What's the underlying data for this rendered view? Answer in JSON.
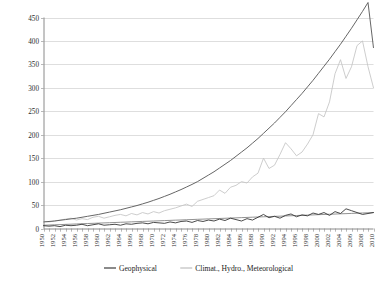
{
  "chart_data": {
    "type": "line",
    "title": "",
    "subtitle": "",
    "xlabel": "",
    "ylabel": "",
    "xlim": [
      1950,
      2010
    ],
    "ylim": [
      0,
      450
    ],
    "ytick_step": 50,
    "xtick_step": 1,
    "xlabel_step": 2,
    "grid": true,
    "legend_position": "bottom",
    "yticks": [
      "0",
      "50",
      "100",
      "150",
      "200",
      "250",
      "300",
      "350",
      "400",
      "450"
    ],
    "xticks": [
      "1950",
      "1952",
      "1954",
      "1956",
      "1958",
      "1960",
      "1962",
      "1964",
      "1966",
      "1968",
      "1970",
      "1972",
      "1974",
      "1976",
      "1978",
      "1980",
      "1982",
      "1984",
      "1986",
      "1988",
      "1990",
      "1992",
      "1994",
      "1996",
      "1998",
      "2000",
      "2002",
      "2004",
      "2006",
      "2008",
      "2010"
    ],
    "x": [
      1950,
      1951,
      1952,
      1953,
      1954,
      1955,
      1956,
      1957,
      1958,
      1959,
      1960,
      1961,
      1962,
      1963,
      1964,
      1965,
      1966,
      1967,
      1968,
      1969,
      1970,
      1971,
      1972,
      1973,
      1974,
      1975,
      1976,
      1977,
      1978,
      1979,
      1980,
      1981,
      1982,
      1983,
      1984,
      1985,
      1986,
      1987,
      1988,
      1989,
      1990,
      1991,
      1992,
      1993,
      1994,
      1995,
      1996,
      1997,
      1998,
      1999,
      2000,
      2001,
      2002,
      2003,
      2004,
      2005,
      2006,
      2007,
      2008,
      2009,
      2010
    ],
    "series": [
      {
        "name": "Geophysical",
        "color": "#2a2a2a",
        "style": "solid",
        "values": [
          6,
          5,
          6,
          4,
          7,
          6,
          7,
          9,
          6,
          8,
          10,
          7,
          8,
          9,
          7,
          10,
          9,
          11,
          12,
          10,
          13,
          12,
          11,
          14,
          12,
          15,
          16,
          13,
          17,
          15,
          18,
          16,
          20,
          17,
          22,
          19,
          16,
          21,
          18,
          24,
          30,
          23,
          26,
          22,
          28,
          31,
          25,
          29,
          27,
          33,
          30,
          34,
          28,
          36,
          32,
          42,
          38,
          34,
          30,
          32,
          34
        ]
      },
      {
        "name": "Geophysical trend",
        "color": "#6e6e6e",
        "style": "trend",
        "values": [
          7,
          7.4,
          7.9,
          8.3,
          8.8,
          9.2,
          9.7,
          10.1,
          10.6,
          11,
          11.5,
          11.9,
          12.4,
          12.8,
          13.3,
          13.7,
          14.2,
          14.6,
          15.1,
          15.5,
          16,
          16.4,
          16.9,
          17.3,
          17.8,
          18.2,
          18.7,
          19.1,
          19.6,
          20,
          20.5,
          20.9,
          21.4,
          21.8,
          22.3,
          22.7,
          23.2,
          23.6,
          24.1,
          24.5,
          25,
          25.4,
          25.9,
          26.3,
          26.8,
          27.2,
          27.7,
          28.1,
          28.6,
          29,
          29.5,
          29.9,
          30.4,
          30.8,
          31.3,
          31.7,
          32.2,
          32.6,
          33.1,
          33.5,
          34
        ]
      },
      {
        "name": "Climat., Hydro., Meteorological",
        "color": "#c4c4c4",
        "style": "solid",
        "values": [
          15,
          14,
          16,
          18,
          20,
          22,
          18,
          21,
          19,
          24,
          26,
          22,
          25,
          28,
          30,
          27,
          32,
          29,
          34,
          31,
          36,
          33,
          38,
          41,
          44,
          48,
          52,
          47,
          58,
          62,
          66,
          70,
          82,
          75,
          88,
          92,
          100,
          97,
          110,
          118,
          150,
          128,
          135,
          158,
          183,
          170,
          155,
          163,
          180,
          200,
          245,
          238,
          270,
          330,
          360,
          320,
          345,
          390,
          400,
          345,
          300
        ]
      },
      {
        "name": "Climat., Hydro., Meteorological trend",
        "color": "#555555",
        "style": "trend",
        "values": [
          14,
          15,
          16,
          17.5,
          19,
          20.5,
          22,
          24,
          26,
          28,
          30,
          32.5,
          35,
          37.5,
          40,
          43,
          46,
          49,
          52.5,
          56,
          60,
          64,
          68.5,
          73,
          78,
          83,
          88.5,
          94,
          100,
          107,
          114,
          121,
          129,
          137,
          145,
          154,
          163,
          172,
          182,
          192,
          203,
          214,
          225,
          237,
          249,
          262,
          275,
          288,
          302,
          316,
          331,
          346,
          361,
          377,
          393,
          410,
          427,
          445,
          463,
          482,
          385
        ]
      }
    ],
    "legend": [
      {
        "label": "Geophysical",
        "color": "#2a2a2a"
      },
      {
        "label": "Climat., Hydro., Meteorological",
        "color": "#b9b9b9"
      }
    ]
  }
}
